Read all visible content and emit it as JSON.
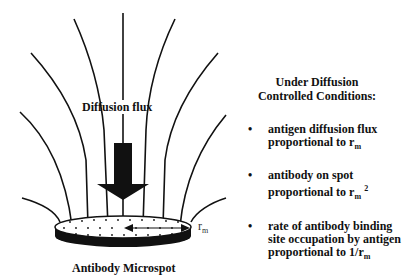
{
  "diagram": {
    "flux_label": "Diffusion flux",
    "spot_label": "Antibody Microspot",
    "radius_label": {
      "base": "r",
      "sub": "m"
    }
  },
  "panel": {
    "title_line1": "Under Diffusion",
    "title_line2": "Controlled Conditions:",
    "bullets": [
      {
        "line1": "antigen diffusion flux",
        "line2_prefix": "proportional to r",
        "sub": "m",
        "sup": ""
      },
      {
        "line1": "antibody on spot",
        "line2_prefix": "proportional to r",
        "sub": "m",
        "sup": "2"
      },
      {
        "line1": "rate of  antibody binding",
        "line1b": "site occupation by antigen",
        "line2_prefix": "proportional to 1/r",
        "sub": "m",
        "sup": ""
      }
    ]
  },
  "colors": {
    "ink": "#111111",
    "background": "#ffffff"
  }
}
